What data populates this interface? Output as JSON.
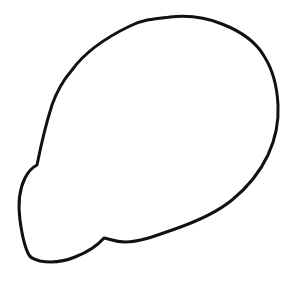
{
  "drawing": {
    "description": "Hand-drawn closed outline of a rounded blob shape (head/brain-like silhouette) on a white background",
    "background_color": "#ffffff",
    "stroke_color": "#111111",
    "stroke_width": 3,
    "fill_color": "none",
    "outline_path": "M37,165 C40,150 44,130 52,105 C58,88 65,78 72,70 C85,52 105,38 130,26 C142,20 152,19 170,17 C188,15 205,17 222,24 C240,31 256,42 264,56 C273,70 277,85 278,105 C279,125 275,140 268,155 C260,172 248,187 232,200 C215,214 195,222 175,229 C158,235 140,242 125,242 C115,242 110,239 104,238 C98,245 88,252 75,257 C63,262 52,263 40,261 C33,259 30,257 29,255 C25,248 22,235 20,220 C18,205 19,190 25,178 C29,170 33,167 37,165 Z"
  }
}
